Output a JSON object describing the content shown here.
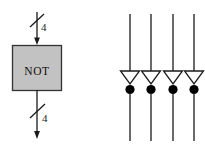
{
  "figure": {
    "background_color": "#ffffff",
    "stroke_color": "#1a1a1a",
    "block_fill_color": "#c2c2c2",
    "block_border_color": "#333333",
    "bubble_fill_color": "#000000",
    "left_diagram": {
      "block": {
        "label": "NOT",
        "shape": "rectangle"
      },
      "input_bus": {
        "label": "4",
        "slash_marker": true,
        "arrow_direction": "down"
      },
      "output_bus": {
        "label": "4",
        "slash_marker": true,
        "arrow_direction": "down"
      }
    },
    "right_diagram": {
      "description": "four parallel inverters",
      "inverter_count": 4,
      "inverters": [
        {
          "name": "inverter-1",
          "bubble": true
        },
        {
          "name": "inverter-2",
          "bubble": true
        },
        {
          "name": "inverter-3",
          "bubble": true
        },
        {
          "name": "inverter-4",
          "bubble": true
        }
      ]
    }
  }
}
